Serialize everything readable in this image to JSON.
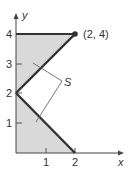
{
  "diagram": {
    "type": "region-plot",
    "axes": {
      "x_label": "x",
      "y_label": "y",
      "x_ticks": [
        "1",
        "2"
      ],
      "y_ticks": [
        "1",
        "2",
        "3",
        "4"
      ]
    },
    "point": {
      "label": "(2, 4)",
      "x": 2,
      "y": 4
    },
    "region_label": "S",
    "boundary_segments": [
      {
        "from": [
          0,
          4
        ],
        "to": [
          2,
          4
        ]
      },
      {
        "from": [
          0,
          2
        ],
        "to": [
          2,
          4
        ]
      },
      {
        "from": [
          0,
          2
        ],
        "to": [
          2,
          0
        ]
      }
    ],
    "shaded_regions": [
      {
        "vertices": [
          [
            0,
            2
          ],
          [
            2,
            4
          ],
          [
            0,
            4
          ]
        ]
      },
      {
        "vertices": [
          [
            0,
            0
          ],
          [
            2,
            0
          ],
          [
            0,
            2
          ]
        ]
      }
    ],
    "colors": {
      "shade": "#d9d9d9",
      "line": "#333333",
      "axis": "#444444"
    }
  }
}
